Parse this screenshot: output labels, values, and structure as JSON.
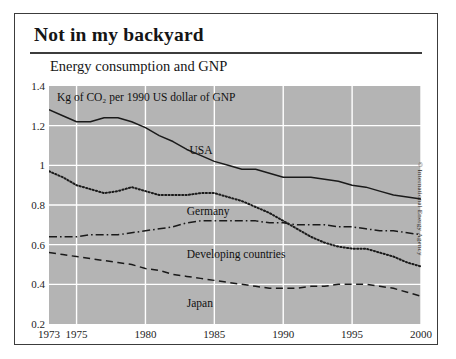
{
  "card": {
    "headline": "Not in my backyard",
    "chart_title": "Energy consumption and GNP",
    "credit": "© International Energy Agency"
  },
  "chart_data": {
    "type": "line",
    "title": "Energy consumption and GNP",
    "subtitle": "Kg of CO₂ per 1990 US dollar of GNP",
    "xlabel": "",
    "ylabel": "Kg of CO2 per 1990 US dollar of GNP",
    "xlim": [
      1973,
      2000
    ],
    "ylim": [
      0.2,
      1.4
    ],
    "yticks": [
      0.2,
      0.4,
      0.6,
      0.8,
      1,
      1.2,
      1.4
    ],
    "ytick_labels": [
      "0.2",
      "0.4",
      "0.6",
      "0.8",
      "1",
      "1.2",
      "1.4"
    ],
    "xticks": [
      1973,
      1975,
      1980,
      1985,
      1990,
      1995,
      2000
    ],
    "xtick_labels": [
      "1973",
      "1975",
      "1980",
      "1985",
      "1990",
      "1995",
      "2000"
    ],
    "grid": true,
    "legend_position": "inline-annotations",
    "plot_background": "#b4b4b4",
    "gridline_color": "#ffffff",
    "x": [
      1973,
      1974,
      1975,
      1976,
      1977,
      1978,
      1979,
      1980,
      1981,
      1982,
      1983,
      1984,
      1985,
      1986,
      1987,
      1988,
      1989,
      1990,
      1991,
      1992,
      1993,
      1994,
      1995,
      1996,
      1997,
      1998,
      1999,
      2000
    ],
    "series": [
      {
        "name": "USA",
        "style": "solid",
        "color": "#1a1a1a",
        "values": [
          1.28,
          1.25,
          1.22,
          1.22,
          1.24,
          1.24,
          1.22,
          1.19,
          1.15,
          1.12,
          1.08,
          1.05,
          1.02,
          1.0,
          0.98,
          0.98,
          0.96,
          0.94,
          0.94,
          0.94,
          0.93,
          0.92,
          0.9,
          0.89,
          0.87,
          0.85,
          0.84,
          0.83
        ]
      },
      {
        "name": "Germany",
        "style": "dotted",
        "color": "#1a1a1a",
        "values": [
          0.97,
          0.94,
          0.9,
          0.88,
          0.86,
          0.87,
          0.89,
          0.87,
          0.85,
          0.85,
          0.85,
          0.86,
          0.86,
          0.84,
          0.82,
          0.79,
          0.76,
          0.72,
          0.68,
          0.64,
          0.61,
          0.59,
          0.58,
          0.58,
          0.56,
          0.54,
          0.51,
          0.49
        ]
      },
      {
        "name": "Developing countries",
        "style": "dashdot",
        "color": "#1a1a1a",
        "values": [
          0.64,
          0.64,
          0.64,
          0.65,
          0.65,
          0.65,
          0.66,
          0.67,
          0.68,
          0.69,
          0.71,
          0.72,
          0.72,
          0.72,
          0.72,
          0.72,
          0.71,
          0.71,
          0.7,
          0.7,
          0.7,
          0.69,
          0.69,
          0.68,
          0.67,
          0.67,
          0.66,
          0.65
        ]
      },
      {
        "name": "Japan",
        "style": "dashed",
        "color": "#1a1a1a",
        "values": [
          0.56,
          0.55,
          0.54,
          0.53,
          0.52,
          0.51,
          0.5,
          0.48,
          0.47,
          0.45,
          0.44,
          0.43,
          0.42,
          0.41,
          0.4,
          0.39,
          0.38,
          0.38,
          0.38,
          0.39,
          0.39,
          0.4,
          0.4,
          0.4,
          0.39,
          0.38,
          0.36,
          0.34
        ]
      }
    ],
    "annotations": [
      {
        "text": "USA",
        "x": 1983.2,
        "y": 1.11
      },
      {
        "text": "Germany",
        "x": 1983.0,
        "y": 0.8
      },
      {
        "text": "Developing countries",
        "x": 1983.0,
        "y": 0.585
      },
      {
        "text": "Japan",
        "x": 1983.0,
        "y": 0.335
      },
      {
        "text": "Kg of CO₂ per 1990 US dollar of GNP",
        "x": 1973.6,
        "y": 1.355
      }
    ]
  }
}
